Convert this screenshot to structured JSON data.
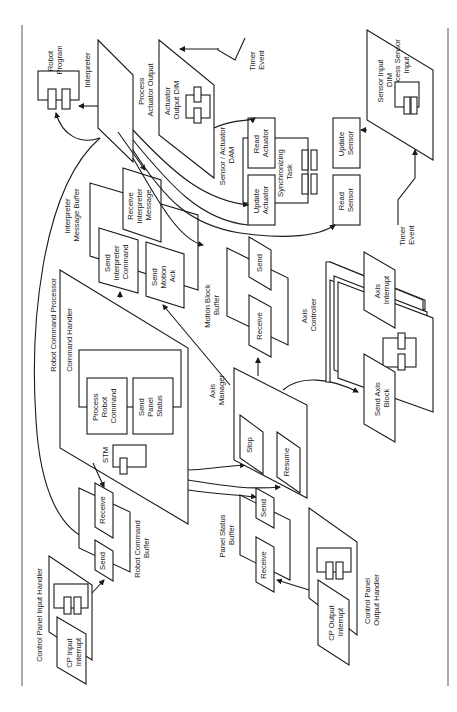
{
  "figure": {
    "orientation": "rotated 90 degrees counter-clockwise",
    "type": "software architecture block diagram",
    "colors": {
      "ink": "#1a1a1a",
      "background": "#ffffff",
      "frame": "#555555"
    }
  },
  "labels": {
    "robot_program": [
      "Robot",
      "Program"
    ],
    "interpreter": "Interpreter",
    "process_actuator_output": [
      "Process",
      "Actuator Output"
    ],
    "actuator_output_dim": [
      "Actuator",
      "Output DIM"
    ],
    "timer_event_top": [
      "Timer",
      "Event"
    ],
    "timer_event_bottom": [
      "Timer",
      "Event"
    ],
    "sensor_actuator_dam": [
      "Sensor / Actuator",
      "DAM"
    ],
    "read_actuator": [
      "Read",
      "Actuator"
    ],
    "update_actuator": [
      "Update",
      "Actuator"
    ],
    "synchronizing_task": [
      "Synchronizing",
      "Task"
    ],
    "update_sensor": [
      "Update",
      "Sensor"
    ],
    "read_sensor": [
      "Read",
      "Sensor"
    ],
    "process_sensor_input": [
      "Process Sensor",
      "Input"
    ],
    "sensor_input_dim": [
      "Sensor Input",
      "DIM"
    ],
    "interpreter_message_buffer": [
      "Interpreter",
      "Message Buffer"
    ],
    "receive_interpreter_message": [
      "Receive",
      "Interpreter",
      "Message"
    ],
    "send_interpreter_command": [
      "Send",
      "Interpreter",
      "Command"
    ],
    "send_motion_ack": [
      "Send",
      "Motion",
      "Ack"
    ],
    "motion_block_buffer": [
      "Motion Block",
      "Buffer"
    ],
    "mb_send": "Send",
    "mb_receive": "Receive",
    "robot_command_processor": "Robot Command Processor",
    "command_handler": "Command Handler",
    "process_robot_command": [
      "Process",
      "Robot",
      "Command"
    ],
    "send_panel_status": [
      "Send",
      "Panel",
      "Status"
    ],
    "stm": "STM",
    "axis_manager": [
      "Axis",
      "Manager"
    ],
    "stop": "Stop",
    "resume": "Resume",
    "axis_controller": [
      "Axis",
      "Controller"
    ],
    "axis_interrupt": [
      "Axis",
      "Interrupt"
    ],
    "send_axis_block": [
      "Send Axis",
      "Block"
    ],
    "robot_command_buffer": [
      "Robot Command",
      "Buffer"
    ],
    "rcb_receive": "Receive",
    "rcb_send": "Send",
    "control_panel_input_handler": "Control Panel Input Handler",
    "cp_input_interrupt": [
      "CP Input",
      "Interrupt"
    ],
    "panel_status_buffer": [
      "Panel Status",
      "Buffer"
    ],
    "psb_send": "Send",
    "psb_receive": "Receive",
    "control_panel_output_handler": [
      "Control Panel",
      "Output Handler"
    ],
    "cp_output_interrupt": [
      "CP Output",
      "Interrupt"
    ]
  }
}
